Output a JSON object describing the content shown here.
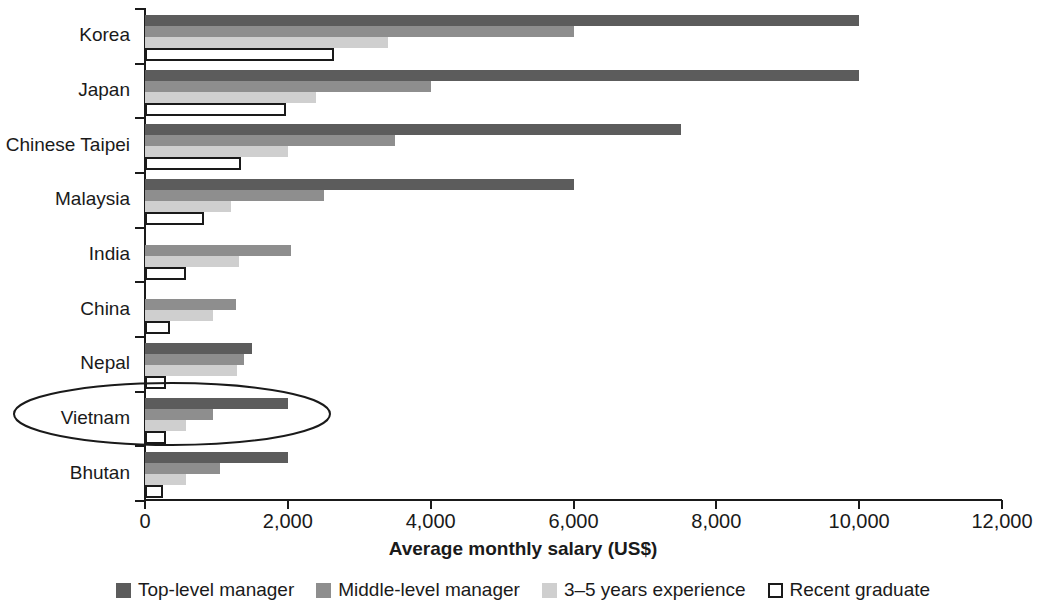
{
  "chart_data": {
    "type": "bar",
    "orientation": "horizontal",
    "title": "",
    "xlabel": "Average monthly salary (US$)",
    "ylabel": "",
    "xlim": [
      0,
      12000
    ],
    "xticks": [
      0,
      2000,
      4000,
      6000,
      8000,
      10000,
      12000
    ],
    "xtick_labels": [
      "0",
      "2,000",
      "4,000",
      "6,000",
      "8,000",
      "10,000",
      "12,000"
    ],
    "grid": false,
    "legend_position": "bottom",
    "categories": [
      "Korea",
      "Japan",
      "Chinese Taipei",
      "Malaysia",
      "India",
      "China",
      "Nepal",
      "Vietnam",
      "Bhutan"
    ],
    "series": [
      {
        "name": "Top-level manager",
        "color": "#5c5c5c",
        "values": [
          10000,
          10000,
          7500,
          6000,
          null,
          null,
          1500,
          2000,
          2000
        ]
      },
      {
        "name": "Middle-level manager",
        "color": "#8e8e8e",
        "values": [
          6000,
          4000,
          3500,
          2500,
          2050,
          1280,
          1380,
          950,
          1050
        ]
      },
      {
        "name": "3–5 years experience",
        "color": "#cfcfcf",
        "values": [
          3400,
          2400,
          2000,
          1200,
          1320,
          950,
          1290,
          580,
          580
        ]
      },
      {
        "name": "Recent graduate",
        "color": "#ffffff",
        "values": [
          2650,
          1980,
          1350,
          830,
          580,
          350,
          290,
          290,
          250
        ]
      }
    ],
    "annotations": [
      {
        "type": "ellipse",
        "target": "Vietnam",
        "label": ""
      }
    ]
  },
  "legend": {
    "items": [
      {
        "label": "Top-level manager",
        "swatch": "solid-dark-gray"
      },
      {
        "label": "Middle-level manager",
        "swatch": "solid-medium-gray"
      },
      {
        "label": "3–5 years experience",
        "swatch": "solid-light-gray"
      },
      {
        "label": "Recent graduate",
        "swatch": "outlined-white"
      }
    ]
  }
}
